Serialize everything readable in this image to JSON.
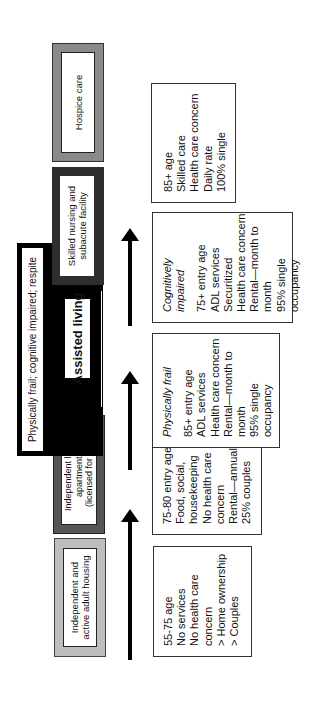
{
  "diagram": {
    "stages": [
      {
        "id": "independent_active",
        "label": "Independent and\nactive adult housing",
        "border_color": "#b8b8b8"
      },
      {
        "id": "independent_living",
        "label": "Independent living\napartments\n(licensed for AL)",
        "border_color": "#555555"
      },
      {
        "id": "assisted_living",
        "label": "Assisted living",
        "border_color": "#000000"
      },
      {
        "id": "skilled_nursing",
        "label": "Skilled nursing and\nsubacute facility",
        "border_color": "#2e2e2e"
      },
      {
        "id": "hospice",
        "label": "Hospice care",
        "border_color": "#8a8a8a"
      }
    ],
    "assisted_living_banner": "Physically frail; cognitive impaired; respite",
    "details": [
      {
        "id": "independent_active",
        "heading": "",
        "lines": [
          "55-75 age",
          "No services",
          "No health care",
          "concern",
          "> Home ownership",
          "> Couples"
        ]
      },
      {
        "id": "independent_living",
        "heading": "",
        "lines": [
          "75-80 entry age",
          "Food, social,",
          "housekeeping",
          "No health care",
          "concern",
          "Rental—annual",
          "25% couples"
        ]
      },
      {
        "id": "physically_frail",
        "heading": "Physically frail",
        "lines": [
          "85+ entry age",
          "ADL services",
          "Health care concern",
          "Rental—month to",
          "month",
          "95% single",
          "occupancy"
        ]
      },
      {
        "id": "cognitively_impaired",
        "heading": "Cognitively impaired",
        "lines": [
          "75+ entry age",
          "ADL services",
          "Securitized",
          "Health care concern",
          "Rental—month to",
          "month",
          "95% single",
          "occupancy"
        ]
      },
      {
        "id": "skilled_nursing",
        "heading": "",
        "lines": [
          "85+ age",
          "Skilled care",
          "Health care concern",
          "Daily rate",
          "100% single"
        ]
      }
    ],
    "arrows": [
      "arrow-1",
      "arrow-2",
      "arrow-3"
    ]
  }
}
